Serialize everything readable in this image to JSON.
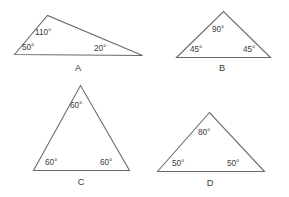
{
  "figure": {
    "background_color": "#ffffff",
    "stroke_color": "#6a6a6a",
    "text_color": "#3a3a3a",
    "degree_symbol": "°",
    "triangles": [
      {
        "name": "A",
        "label": "A",
        "type": "obtuse-scalene",
        "angles": [
          {
            "label": "110°",
            "value": 110,
            "position": "apex"
          },
          {
            "label": "50°",
            "value": 50,
            "position": "bottom-left"
          },
          {
            "label": "20°",
            "value": 20,
            "position": "bottom-right"
          }
        ]
      },
      {
        "name": "B",
        "label": "B",
        "type": "right-isosceles",
        "angles": [
          {
            "label": "90°",
            "value": 90,
            "position": "apex"
          },
          {
            "label": "45°",
            "value": 45,
            "position": "bottom-left"
          },
          {
            "label": "45°",
            "value": 45,
            "position": "bottom-right"
          }
        ]
      },
      {
        "name": "C",
        "label": "C",
        "type": "equilateral",
        "angles": [
          {
            "label": "60°",
            "value": 60,
            "position": "apex"
          },
          {
            "label": "60°",
            "value": 60,
            "position": "bottom-left"
          },
          {
            "label": "60°",
            "value": 60,
            "position": "bottom-right"
          }
        ]
      },
      {
        "name": "D",
        "label": "D",
        "type": "acute-isosceles",
        "angles": [
          {
            "label": "80°",
            "value": 80,
            "position": "apex"
          },
          {
            "label": "50°",
            "value": 50,
            "position": "bottom-left"
          },
          {
            "label": "50°",
            "value": 50,
            "position": "bottom-right"
          }
        ]
      }
    ]
  }
}
